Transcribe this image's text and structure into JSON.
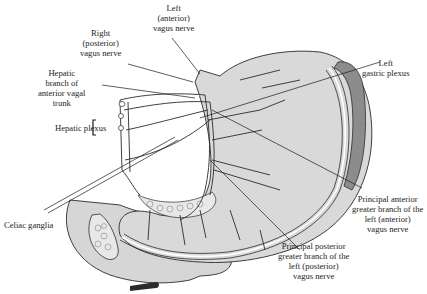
{
  "figure": {
    "colors": {
      "stomach_fill": "#d9d9d9",
      "stomach_light": "#ececec",
      "omentum_fold": "#8c8c8c",
      "outline": "#2b2b2b",
      "background": "#ffffff"
    },
    "signature": "J. Fabus"
  },
  "labels": {
    "left_vagus": [
      "Left",
      "(anterior)",
      "vagus nerve"
    ],
    "right_vagus": [
      "Right",
      "(posterior)",
      "vagus nerve"
    ],
    "hepatic_branch": [
      "Hepatic",
      "branch of",
      "anterior vagal",
      "trunk"
    ],
    "hepatic_plexus": "Hepatic plexus",
    "left_gastric_plexus": [
      "Left",
      "gastric plexus"
    ],
    "celiac_ganglia": "Celiac ganglia",
    "anterior_branch": [
      "Principal anterior",
      "greater branch of the",
      "left (anterior)",
      "vagus nerve"
    ],
    "posterior_branch": [
      "Principal posterior",
      "greater branch of the",
      "left (posterior)",
      "vagus nerve"
    ]
  }
}
